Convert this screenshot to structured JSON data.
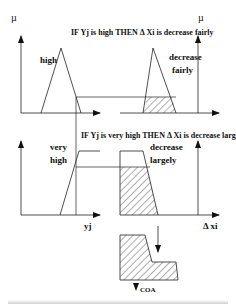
{
  "figure": {
    "rules": [
      {
        "text": "IF Yj is high THEN Δ Xi is decrease  fairly"
      },
      {
        "text": "IF Yj is very high THEN Δ Xi is decrease largely"
      }
    ],
    "axes": {
      "mu_left": "µ",
      "mu_right": "µ",
      "input_label": "yj",
      "output_label": "Δ xi"
    },
    "sets": {
      "input_1": {
        "line1": "high"
      },
      "output_1": {
        "line1": "decrease",
        "line2": "fairly"
      },
      "input_2": {
        "line1": "very",
        "line2": "high"
      },
      "output_2": {
        "line1": "decrease",
        "line2": "largely"
      }
    },
    "result": {
      "label": "COA"
    },
    "colors": {
      "stroke": "#222222",
      "hatch": "#333333",
      "background": "#ffffff"
    }
  }
}
